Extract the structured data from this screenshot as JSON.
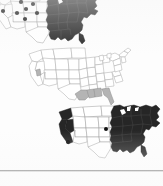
{
  "page": {
    "kind": "scanned-figure-page",
    "background_color": "#fdfdfd",
    "width": 163,
    "height": 186,
    "rule_color": "#8e8e8e"
  },
  "palette": {
    "fill_dark": "#262626",
    "fill_gray": "#b0b0b0",
    "fill_light": "#ffffff",
    "outline": "#9a9a9a",
    "outline_dark": "#6f6f6f",
    "marker": "#111111"
  },
  "chart_data": [
    {
      "type": "choropleth",
      "id": "map-top",
      "title": "",
      "region": "United States",
      "legend": [],
      "classes": [
        {
          "name": "shaded",
          "color": "#262626"
        },
        {
          "name": "unshaded",
          "color": "#ffffff"
        }
      ],
      "shaded_states": [
        "ME",
        "NH",
        "VT",
        "MA",
        "RI",
        "CT",
        "NY",
        "NJ",
        "PA",
        "DE",
        "MD",
        "VA",
        "WV",
        "NC",
        "SC",
        "GA",
        "FL",
        "AL",
        "MS",
        "TN",
        "KY",
        "OH",
        "IN",
        "IL",
        "MI",
        "WI",
        "MN",
        "IA",
        "MO",
        "AR",
        "LA"
      ],
      "unshaded_states": [
        "WA",
        "OR",
        "CA",
        "NV",
        "ID",
        "MT",
        "WY",
        "UT",
        "AZ",
        "CO",
        "NM",
        "ND",
        "SD",
        "NE",
        "KS",
        "OK",
        "TX"
      ],
      "point_markers": [
        {
          "x": 6,
          "y": 7
        },
        {
          "x": 16,
          "y": 4
        },
        {
          "x": 26,
          "y": 11
        },
        {
          "x": 8,
          "y": 20
        },
        {
          "x": 22,
          "y": 22
        },
        {
          "x": 31,
          "y": 18
        },
        {
          "x": 38,
          "y": 13
        },
        {
          "x": 42,
          "y": 22
        },
        {
          "x": 30,
          "y": 28
        }
      ]
    },
    {
      "type": "choropleth",
      "id": "map-middle",
      "title": "",
      "region": "United States",
      "legend": [],
      "classes": [
        {
          "name": "shaded",
          "color": "#b0b0b0"
        },
        {
          "name": "unshaded",
          "color": "#ffffff"
        }
      ],
      "shaded_states": [
        "LA",
        "MS",
        "AL",
        "FL",
        "CA"
      ],
      "unshaded_states": [
        "WA",
        "OR",
        "NV",
        "ID",
        "MT",
        "WY",
        "UT",
        "AZ",
        "CO",
        "NM",
        "ND",
        "SD",
        "NE",
        "KS",
        "OK",
        "TX",
        "MN",
        "IA",
        "MO",
        "AR",
        "WI",
        "IL",
        "IN",
        "MI",
        "OH",
        "KY",
        "TN",
        "GA",
        "SC",
        "NC",
        "VA",
        "WV",
        "PA",
        "NY",
        "NJ",
        "DE",
        "MD",
        "CT",
        "RI",
        "MA",
        "VT",
        "NH",
        "ME"
      ],
      "point_markers": []
    },
    {
      "type": "choropleth",
      "id": "map-bottom",
      "title": "",
      "region": "United States",
      "legend": [],
      "classes": [
        {
          "name": "shaded",
          "color": "#262626"
        },
        {
          "name": "unshaded",
          "color": "#ffffff"
        }
      ],
      "shaded_states": [
        "WA",
        "OR",
        "CA",
        "MN",
        "WI",
        "MI",
        "IL",
        "IN",
        "OH",
        "KY",
        "TN",
        "MS",
        "AL",
        "GA",
        "FL",
        "SC",
        "NC",
        "VA",
        "WV",
        "PA",
        "NY",
        "NJ",
        "DE",
        "MD",
        "CT",
        "RI",
        "MA",
        "VT",
        "NH",
        "ME",
        "AR",
        "LA",
        "MO",
        "IA"
      ],
      "unshaded_states": [
        "NV",
        "ID",
        "MT",
        "WY",
        "UT",
        "AZ",
        "CO",
        "NM",
        "ND",
        "SD",
        "NE",
        "KS",
        "OK",
        "TX"
      ],
      "point_markers": [
        {
          "x": 12,
          "y": 38
        },
        {
          "x": 50,
          "y": 25
        }
      ]
    }
  ]
}
